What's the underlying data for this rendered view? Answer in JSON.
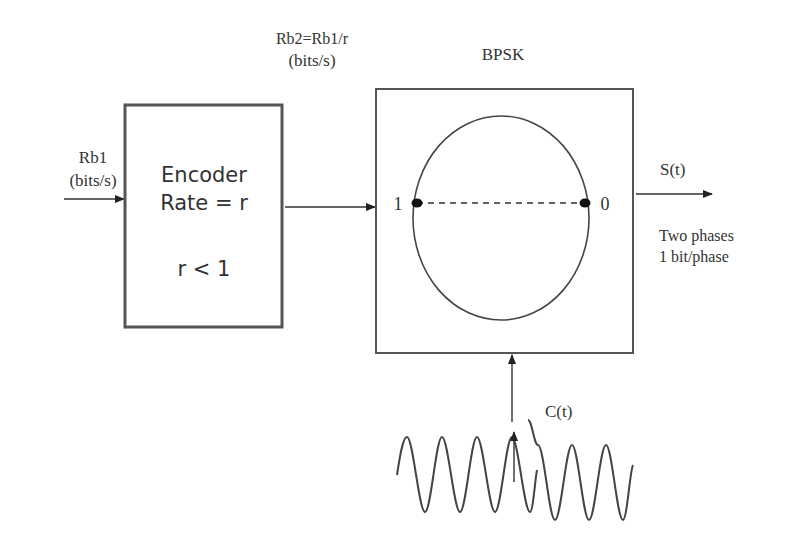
{
  "input": {
    "rate_label": "Rb1",
    "unit_label": "(bits/s)"
  },
  "encoder": {
    "title": "Encoder",
    "rate": "Rate = r",
    "condition": "r < 1"
  },
  "intermediate": {
    "rate_label": "Rb2=Rb1/r",
    "unit_label": "(bits/s)"
  },
  "modulator": {
    "title": "BPSK",
    "constellation": [
      {
        "label": "1",
        "position": "left"
      },
      {
        "label": "0",
        "position": "right"
      }
    ]
  },
  "output": {
    "signal_label": "S(t)",
    "note_line1": "Two phases",
    "note_line2": "1 bit/phase"
  },
  "carrier": {
    "label": "C(t)"
  }
}
